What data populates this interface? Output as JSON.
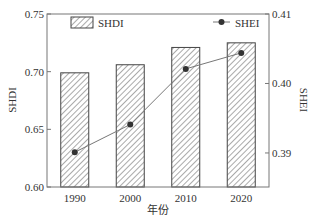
{
  "chart_data": {
    "type": "bar",
    "title": "",
    "xlabel": "年份",
    "ylabel": "SHDI",
    "y2label": "SHEI",
    "categories": [
      "1990",
      "2000",
      "2010",
      "2020"
    ],
    "series": [
      {
        "name": "SHDI",
        "type": "bar",
        "axis": "left",
        "pattern": "hatched",
        "values": [
          0.699,
          0.706,
          0.721,
          0.725
        ]
      },
      {
        "name": "SHEI",
        "type": "line",
        "axis": "right",
        "marker": "circle",
        "values": [
          0.3901,
          0.3941,
          0.4021,
          0.4044
        ]
      }
    ],
    "ylim": [
      0.6,
      0.75
    ],
    "yticks": [
      "0.60",
      "0.65",
      "0.70",
      "0.75"
    ],
    "y2lim": [
      0.3851,
      0.41
    ],
    "y2ticks": [
      "0.39",
      "0.40",
      "0.41"
    ],
    "grid": false,
    "legend": [
      {
        "label": "SHDI",
        "position": "top-left"
      },
      {
        "label": "SHEI",
        "position": "top-right"
      }
    ]
  },
  "colors": {
    "axis": "#555555",
    "bar_edge": "#444444",
    "hatch": "#555555",
    "line": "#777777",
    "marker": "#333333"
  }
}
